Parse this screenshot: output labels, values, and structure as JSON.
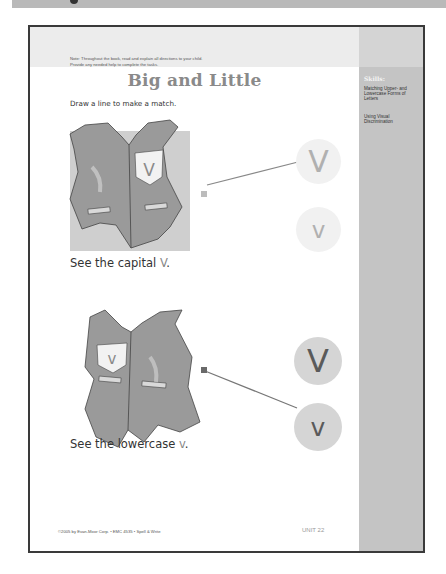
{
  "header": {
    "note_line1": "Note: Throughout the book, read and explain all directions to your child.",
    "note_line2": "Provide any needed help to complete the tasks."
  },
  "page": {
    "title": "Big and Little",
    "directions": "Draw a line to make a match."
  },
  "sidebar": {
    "skills_title": "Skills:",
    "skills": [
      "Matching Upper- and Lowercase Forms of Letters",
      "Using Visual Discrimination"
    ]
  },
  "exercises": [
    {
      "vest_pocket_letter": "V",
      "caption_prefix": "See the capital ",
      "caption_letter": "V",
      "caption_suffix": ".",
      "choices": [
        "V",
        "v"
      ],
      "matched_choice": "V"
    },
    {
      "vest_pocket_letter": "v",
      "caption_prefix": "See the lowercase ",
      "caption_letter": "v",
      "caption_suffix": ".",
      "choices": [
        "V",
        "v"
      ],
      "matched_choice": "v"
    }
  ],
  "footer": {
    "copyright": "©2005 by Evan-Moor Corp. • EMC 4535 • Spell & Write",
    "unit": "UNIT 22",
    "page_number": "109"
  },
  "colors": {
    "border": "#3a3a3a",
    "sidebar": "#c4c4c4",
    "header_band": "#ececec",
    "vest": "#9a9a9a",
    "title": "#8a8a8a"
  }
}
